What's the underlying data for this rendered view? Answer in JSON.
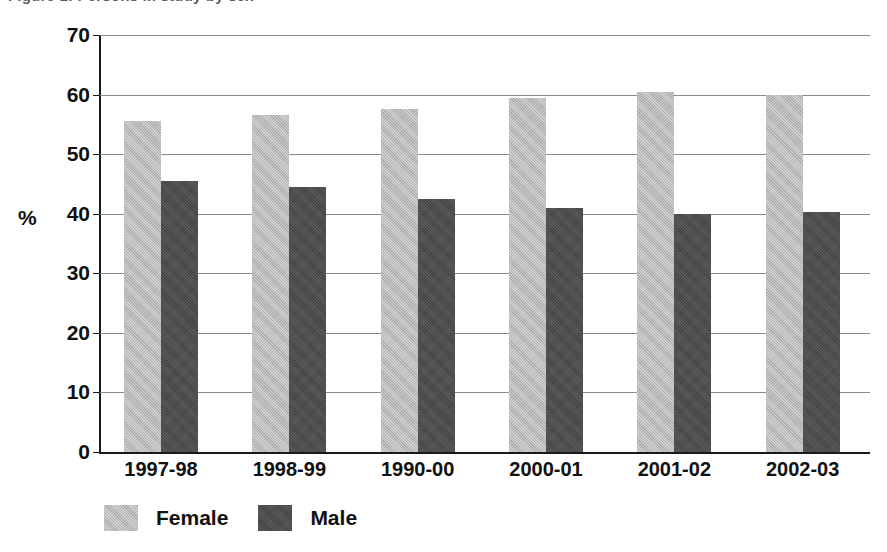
{
  "title": {
    "text": "Figure 1: Persons in study by sex",
    "visible_fragment": true
  },
  "chart_data": {
    "type": "bar",
    "title": "",
    "xlabel": "",
    "ylabel": "%",
    "ylim": [
      0,
      70
    ],
    "ytick_step": 10,
    "ytick_labels": [
      "70",
      "60",
      "50",
      "40",
      "30",
      "20",
      "10",
      "0"
    ],
    "ytick_values": [
      70,
      60,
      50,
      40,
      30,
      20,
      10,
      0
    ],
    "grid": true,
    "grid_axis": "y",
    "legend_position": "bottom-left",
    "categories": [
      "1997-98",
      "1998-99",
      "1990-00",
      "2000-01",
      "2001-02",
      "2002-03"
    ],
    "series": [
      {
        "name": "Female",
        "color": "#b4b4b4",
        "values": [
          55.5,
          56.5,
          57.5,
          59.5,
          60.5,
          60.0
        ]
      },
      {
        "name": "Male",
        "color": "#4b4b4b",
        "values": [
          45.5,
          44.5,
          42.5,
          41.0,
          40.0,
          40.3
        ]
      }
    ]
  },
  "legend": {
    "items": [
      {
        "label": "Female",
        "swatch": "female"
      },
      {
        "label": "Male",
        "swatch": "male"
      }
    ]
  },
  "colors": {
    "female": "#b4b4b4",
    "male": "#4b4b4b",
    "axis": "#1a1a1a",
    "gridline": "#8a8a8a",
    "background": "#ffffff"
  }
}
